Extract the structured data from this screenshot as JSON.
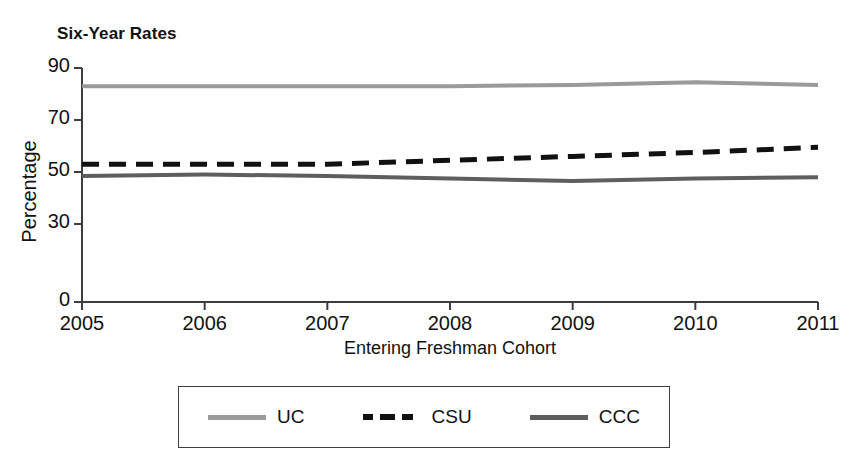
{
  "chart_data": {
    "type": "line",
    "title": "Six-Year Rates",
    "xlabel": "Entering Freshman Cohort",
    "ylabel": "Percentage",
    "x": [
      2005,
      2006,
      2007,
      2008,
      2009,
      2010,
      2011
    ],
    "xtick_labels": [
      "2005",
      "2006",
      "2007",
      "2008",
      "2009",
      "2010",
      "2011"
    ],
    "ytick_labels": [
      "90",
      "70",
      "50",
      "30",
      "0"
    ],
    "yticks": [
      90,
      70,
      50,
      30,
      0
    ],
    "ylim": [
      0,
      90
    ],
    "xlim": [
      2005,
      2011
    ],
    "grid": false,
    "legend_position": "bottom-center",
    "series": [
      {
        "name": "UC",
        "values": [
          83,
          83,
          83,
          83,
          83.5,
          84.5,
          83.5
        ],
        "color": "#9a9a9a",
        "style": "solid",
        "width": 4
      },
      {
        "name": "CSU",
        "values": [
          53,
          53,
          53,
          54.5,
          56,
          57.5,
          59.5
        ],
        "color": "#111111",
        "style": "dashed",
        "width": 5
      },
      {
        "name": "CCC",
        "values": [
          48.5,
          49,
          48.5,
          47.5,
          46.5,
          47.5,
          48
        ],
        "color": "#5e5e5e",
        "style": "solid",
        "width": 4
      }
    ]
  },
  "axes": {
    "y_tick_labels": [
      {
        "text": "90",
        "value": 90
      },
      {
        "text": "70",
        "value": 70
      },
      {
        "text": "50",
        "value": 50
      },
      {
        "text": "30",
        "value": 30
      },
      {
        "text": "0",
        "value": 0
      }
    ],
    "x_tick_labels": [
      {
        "text": "2005",
        "value": 2005
      },
      {
        "text": "2006",
        "value": 2006
      },
      {
        "text": "2007",
        "value": 2007
      },
      {
        "text": "2008",
        "value": 2008
      },
      {
        "text": "2009",
        "value": 2009
      },
      {
        "text": "2010",
        "value": 2010
      },
      {
        "text": "2011",
        "value": 2011
      }
    ],
    "axis_color": "#3d3d3d"
  },
  "legend": {
    "items": [
      {
        "label": "UC",
        "color": "#9a9a9a",
        "style": "solid"
      },
      {
        "label": "CSU",
        "color": "#111111",
        "style": "dashed"
      },
      {
        "label": "CCC",
        "color": "#5e5e5e",
        "style": "solid"
      }
    ]
  }
}
